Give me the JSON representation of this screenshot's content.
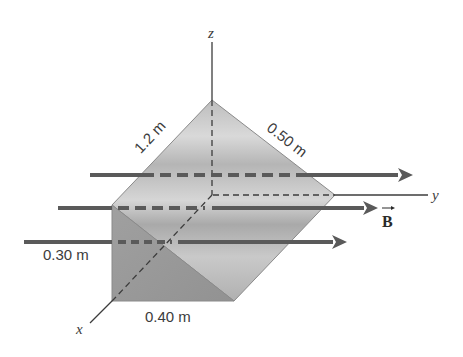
{
  "figure": {
    "axes": {
      "x_label": "x",
      "y_label": "y",
      "z_label": "z"
    },
    "dimensions": {
      "slant_edge": "1.2 m",
      "top_edge": "0.50 m",
      "height": "0.30 m",
      "base": "0.40 m"
    },
    "field": {
      "label": "B",
      "direction": "+y",
      "arrow_count": 3
    },
    "colors": {
      "arrow": "#5a5a5a",
      "front_face": "#9a9a9a",
      "slanted_face": "#c4c4c4",
      "edge": "#7a7a7a",
      "axis": "#3c3c3c"
    }
  }
}
